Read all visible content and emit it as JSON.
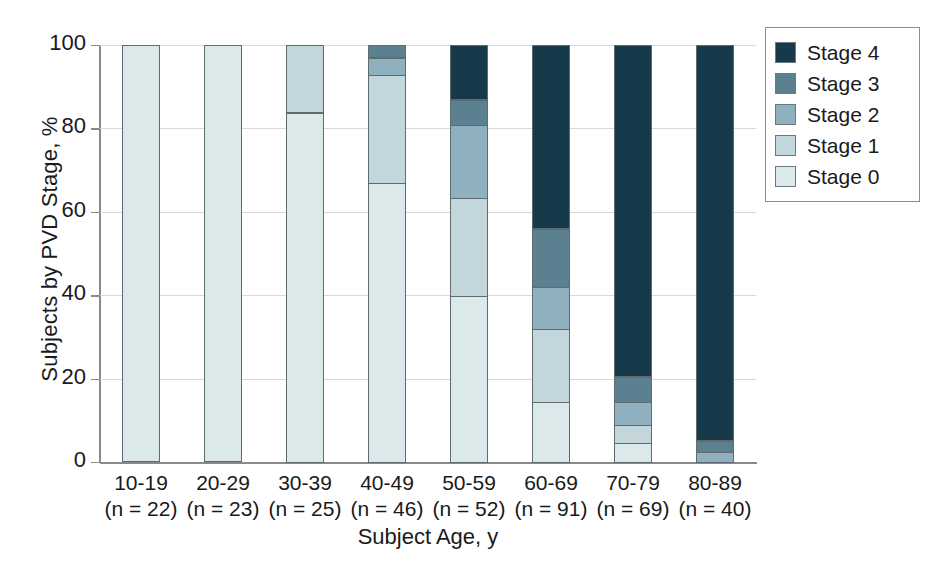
{
  "chart_data": {
    "type": "bar",
    "subtype": "stacked-bar-100pct",
    "title": "",
    "xlabel": "Subject Age, y",
    "ylabel": "Subjects by PVD Stage, %",
    "ylim": [
      0,
      100
    ],
    "yticks": [
      0,
      20,
      40,
      60,
      80,
      100
    ],
    "ytick_labels": [
      "0",
      "20",
      "40",
      "60",
      "80",
      "100"
    ],
    "grid": true,
    "legend_position": "upper right",
    "categories": [
      "10-19",
      "20-29",
      "30-39",
      "40-49",
      "50-59",
      "60-69",
      "70-79",
      "80-89"
    ],
    "category_counts": [
      "(n = 22)",
      "(n = 23)",
      "(n = 25)",
      "(n = 46)",
      "(n = 52)",
      "(n = 91)",
      "(n = 69)",
      "(n = 40)"
    ],
    "series": [
      {
        "name": "Stage 0",
        "color": "#dbe9ea",
        "values": [
          100,
          100,
          84,
          67,
          40,
          14.5,
          4.5,
          0
        ]
      },
      {
        "name": "Stage 1",
        "color": "#c2d6dc",
        "values": [
          0,
          0,
          16,
          26,
          23.5,
          17.5,
          4.5,
          0
        ]
      },
      {
        "name": "Stage 2",
        "color": "#8fb0be",
        "values": [
          0,
          0,
          0,
          4,
          17.5,
          10,
          5.5,
          2.5
        ]
      },
      {
        "name": "Stage 3",
        "color": "#5b8090",
        "values": [
          0,
          0,
          0,
          3,
          6,
          14,
          6,
          2.5
        ]
      },
      {
        "name": "Stage 4",
        "color": "#173a4a",
        "values": [
          0,
          0,
          0,
          0,
          13,
          44,
          79.5,
          95
        ]
      }
    ],
    "cumulative_tops": {
      "10-19": [
        100
      ],
      "20-29": [
        100
      ],
      "30-39": [
        84,
        100
      ],
      "40-49": [
        67,
        93,
        97,
        100
      ],
      "50-59": [
        40,
        63.5,
        81,
        87,
        100
      ],
      "60-69": [
        14.5,
        32,
        42,
        56,
        100
      ],
      "70-79": [
        4.5,
        9,
        14.5,
        20.5,
        100
      ],
      "80-89": [
        0,
        0,
        2.5,
        5,
        100
      ]
    }
  },
  "legend": {
    "entries": [
      {
        "label": "Stage 4",
        "color": "#173a4a"
      },
      {
        "label": "Stage 3",
        "color": "#5b8090"
      },
      {
        "label": "Stage 2",
        "color": "#8fb0be"
      },
      {
        "label": "Stage 1",
        "color": "#c2d6dc"
      },
      {
        "label": "Stage 0",
        "color": "#dbe9ea"
      }
    ]
  },
  "axes": {
    "y_title": "Subjects by PVD Stage, %",
    "x_title": "Subject Age, y"
  }
}
